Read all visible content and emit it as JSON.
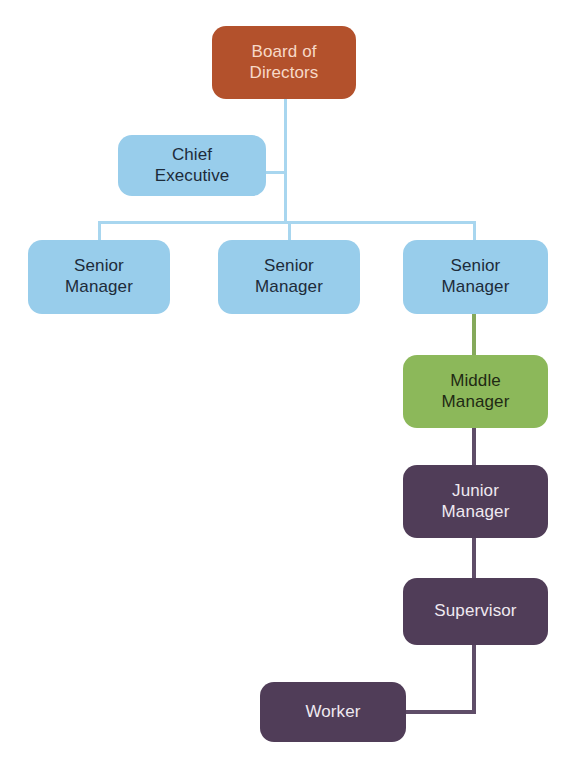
{
  "diagram": {
    "type": "org-chart",
    "background_color": "#ffffff",
    "palette": {
      "board_fill": "#b3512c",
      "board_text": "#f7d9c8",
      "blue_fill": "#98cdeb",
      "blue_text": "#1d2b3a",
      "green_fill": "#8cb85a",
      "green_text": "#1f2a14",
      "purple_fill": "#503d58",
      "purple_text": "#efe9f0",
      "blue_line": "#a8d6ef",
      "green_line": "#85a95a",
      "purple_line": "#5f4d68"
    },
    "nodes": [
      {
        "id": "board-of-directors",
        "label": "Board of\nDirectors",
        "level": 1,
        "fill": "#b3512c",
        "text_color": "#f7d9c8",
        "font_size": 17,
        "x": 212,
        "y": 26,
        "w": 144,
        "h": 73
      },
      {
        "id": "chief-executive",
        "label": "Chief\nExecutive",
        "level": 2,
        "fill": "#98cdeb",
        "text_color": "#1d2b3a",
        "font_size": 17,
        "x": 118,
        "y": 135,
        "w": 148,
        "h": 61
      },
      {
        "id": "senior-manager-1",
        "label": "Senior\nManager",
        "level": 3,
        "fill": "#98cdeb",
        "text_color": "#1d2b3a",
        "font_size": 17,
        "x": 28,
        "y": 240,
        "w": 142,
        "h": 74
      },
      {
        "id": "senior-manager-2",
        "label": "Senior\nManager",
        "level": 3,
        "fill": "#98cdeb",
        "text_color": "#1d2b3a",
        "font_size": 17,
        "x": 218,
        "y": 240,
        "w": 142,
        "h": 74
      },
      {
        "id": "senior-manager-3",
        "label": "Senior\nManager",
        "level": 3,
        "fill": "#98cdeb",
        "text_color": "#1d2b3a",
        "font_size": 17,
        "x": 403,
        "y": 240,
        "w": 145,
        "h": 74
      },
      {
        "id": "middle-manager",
        "label": "Middle\nManager",
        "level": 4,
        "fill": "#8cb85a",
        "text_color": "#1f2a14",
        "font_size": 17,
        "x": 403,
        "y": 355,
        "w": 145,
        "h": 73
      },
      {
        "id": "junior-manager",
        "label": "Junior\nManager",
        "level": 5,
        "fill": "#503d58",
        "text_color": "#efe9f0",
        "font_size": 17,
        "x": 403,
        "y": 465,
        "w": 145,
        "h": 73
      },
      {
        "id": "supervisor",
        "label": "Supervisor",
        "level": 6,
        "fill": "#503d58",
        "text_color": "#efe9f0",
        "font_size": 17,
        "x": 403,
        "y": 578,
        "w": 145,
        "h": 67
      },
      {
        "id": "worker",
        "label": "Worker",
        "level": 7,
        "fill": "#503d58",
        "text_color": "#efe9f0",
        "font_size": 17,
        "x": 260,
        "y": 682,
        "w": 146,
        "h": 60
      }
    ],
    "edges": [
      {
        "id": "board-to-trunk",
        "from": "board-of-directors",
        "to": "distribution-bar",
        "color": "#a8d6ef"
      },
      {
        "id": "trunk-to-chief-executive",
        "from": "trunk",
        "to": "chief-executive",
        "color": "#a8d6ef"
      },
      {
        "id": "distribution-bar-to-senior-manager-1",
        "from": "distribution-bar",
        "to": "senior-manager-1",
        "color": "#a8d6ef"
      },
      {
        "id": "distribution-bar-to-senior-manager-2",
        "from": "distribution-bar",
        "to": "senior-manager-2",
        "color": "#a8d6ef"
      },
      {
        "id": "distribution-bar-to-senior-manager-3",
        "from": "distribution-bar",
        "to": "senior-manager-3",
        "color": "#a8d6ef"
      },
      {
        "id": "senior-manager-3-to-middle-manager",
        "from": "senior-manager-3",
        "to": "middle-manager",
        "color": "#85a95a"
      },
      {
        "id": "middle-manager-to-junior-manager",
        "from": "middle-manager",
        "to": "junior-manager",
        "color": "#5f4d68"
      },
      {
        "id": "junior-manager-to-supervisor",
        "from": "junior-manager",
        "to": "supervisor",
        "color": "#5f4d68"
      },
      {
        "id": "supervisor-to-worker",
        "from": "supervisor",
        "to": "worker",
        "color": "#5f4d68"
      }
    ]
  }
}
